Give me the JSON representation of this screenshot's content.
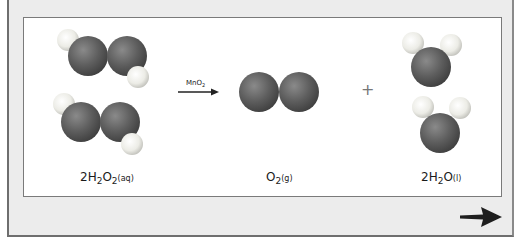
{
  "diagram": {
    "reactant": {
      "label_coef": "2H",
      "label_sub1": "2",
      "label_mid": "O",
      "label_sub2": "2",
      "label_state": "(aq)",
      "text": "2H2O2(aq)"
    },
    "catalyst": {
      "main": "MnO",
      "sub": "2",
      "text": "MnO2"
    },
    "product1": {
      "label_main": "O",
      "label_sub": "2",
      "label_state": "(g)",
      "text": "O2(g)"
    },
    "plus": "+",
    "product2": {
      "label_coef": "2H",
      "label_sub": "2",
      "label_mid": "O",
      "label_state": "(l)",
      "text": "2H2O(l)"
    },
    "colors": {
      "oxygen": "#5a5a5a",
      "hydrogen": "#f2f2ee",
      "frame_bg": "#ececec",
      "panel_bg": "#ffffff",
      "arrow": "#222222"
    }
  },
  "navigation": {
    "next_icon": "right-arrow-icon"
  }
}
